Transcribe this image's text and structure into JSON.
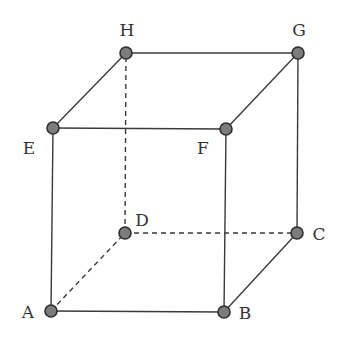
{
  "figure": {
    "type": "cube-wireframe",
    "vertices": [
      {
        "id": "A",
        "label": "A",
        "x": 51,
        "y": 311,
        "lx": 28,
        "ly": 318,
        "anchor": "middle"
      },
      {
        "id": "B",
        "label": "B",
        "x": 224,
        "y": 312,
        "lx": 245,
        "ly": 319,
        "anchor": "middle"
      },
      {
        "id": "C",
        "label": "C",
        "x": 297,
        "y": 233,
        "lx": 319,
        "ly": 240,
        "anchor": "middle"
      },
      {
        "id": "D",
        "label": "D",
        "x": 125,
        "y": 233,
        "lx": 142,
        "ly": 226,
        "anchor": "middle"
      },
      {
        "id": "E",
        "label": "E",
        "x": 53,
        "y": 128,
        "lx": 29,
        "ly": 154,
        "anchor": "middle"
      },
      {
        "id": "F",
        "label": "F",
        "x": 226,
        "y": 129,
        "lx": 203,
        "ly": 154,
        "anchor": "middle"
      },
      {
        "id": "G",
        "label": "G",
        "x": 298,
        "y": 53,
        "lx": 299,
        "ly": 36,
        "anchor": "middle"
      },
      {
        "id": "H",
        "label": "H",
        "x": 126,
        "y": 53,
        "lx": 127,
        "ly": 36,
        "anchor": "middle"
      }
    ],
    "edges": [
      {
        "from": "A",
        "to": "B",
        "style": "solid"
      },
      {
        "from": "B",
        "to": "C",
        "style": "solid"
      },
      {
        "from": "C",
        "to": "G",
        "style": "solid"
      },
      {
        "from": "A",
        "to": "E",
        "style": "solid"
      },
      {
        "from": "B",
        "to": "F",
        "style": "solid"
      },
      {
        "from": "E",
        "to": "F",
        "style": "solid"
      },
      {
        "from": "F",
        "to": "G",
        "style": "solid"
      },
      {
        "from": "G",
        "to": "H",
        "style": "solid"
      },
      {
        "from": "H",
        "to": "E",
        "style": "solid"
      },
      {
        "from": "A",
        "to": "D",
        "style": "dashed"
      },
      {
        "from": "D",
        "to": "C",
        "style": "dashed"
      },
      {
        "from": "D",
        "to": "H",
        "style": "dashed"
      }
    ]
  }
}
